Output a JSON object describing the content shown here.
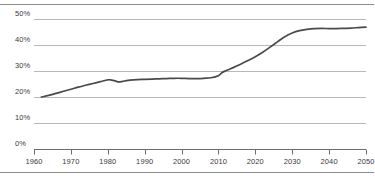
{
  "chart_data": {
    "type": "line",
    "title": "",
    "subtitle": "",
    "xlabel": "",
    "ylabel": "",
    "xlim": [
      1960,
      2050
    ],
    "ylim": [
      0,
      50
    ],
    "grid": true,
    "legend": false,
    "y_ticks": [
      0,
      10,
      20,
      30,
      40,
      50
    ],
    "y_tick_labels": [
      "0%",
      "10%",
      "20%",
      "30%",
      "40%",
      "50%"
    ],
    "x_ticks": [
      1960,
      1970,
      1980,
      1990,
      2000,
      2010,
      2020,
      2030,
      2040,
      2050
    ],
    "x_tick_labels": [
      "1960",
      "1970",
      "1980",
      "1990",
      "2000",
      "2010",
      "2020",
      "2030",
      "2040",
      "2050"
    ],
    "series": [
      {
        "name": "share",
        "color": "#4a4a4a",
        "x": [
          1962,
          1964,
          1966,
          1968,
          1970,
          1972,
          1974,
          1976,
          1978,
          1980,
          1981,
          1982,
          1983,
          1984,
          1985,
          1986,
          1988,
          1990,
          1992,
          1994,
          1996,
          1998,
          2000,
          2002,
          2004,
          2006,
          2008,
          2010,
          2011,
          2012,
          2013,
          2014,
          2016,
          2018,
          2020,
          2022,
          2024,
          2026,
          2028,
          2030,
          2032,
          2034,
          2036,
          2038,
          2040,
          2042,
          2044,
          2046,
          2048,
          2050
        ],
        "y": [
          20.0,
          20.6,
          21.4,
          22.2,
          23.0,
          23.8,
          24.5,
          25.2,
          25.9,
          26.6,
          26.5,
          26.2,
          25.8,
          26.0,
          26.3,
          26.5,
          26.7,
          26.8,
          26.9,
          27.0,
          27.1,
          27.2,
          27.2,
          27.1,
          27.1,
          27.2,
          27.4,
          28.2,
          29.4,
          30.1,
          30.7,
          31.3,
          32.6,
          34.0,
          35.5,
          37.2,
          39.2,
          41.2,
          43.2,
          44.6,
          45.5,
          46.0,
          46.3,
          46.4,
          46.3,
          46.3,
          46.4,
          46.5,
          46.7,
          46.9
        ]
      }
    ]
  },
  "axis": {
    "y_labels": [
      "50%",
      "40%",
      "30%",
      "20%",
      "10%",
      "0%"
    ],
    "x_labels": [
      "1960",
      "1970",
      "1980",
      "1990",
      "2000",
      "2010",
      "2020",
      "2030",
      "2040",
      "2050"
    ]
  },
  "colors": {
    "line": "#4a4a4a",
    "grid": "#b8b8b8",
    "axis": "#6e6e6e",
    "rule": "#8c8c8c",
    "text": "#3a3a3a",
    "background": "#ffffff"
  }
}
